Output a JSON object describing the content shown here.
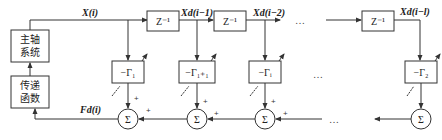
{
  "diagram": {
    "blocks": {
      "spindle_system": {
        "line1": "主轴",
        "line2": "系统"
      },
      "transfer_function": {
        "line1": "传递",
        "line2": "函数"
      },
      "delays": [
        {
          "label": "Z⁻¹"
        },
        {
          "label": "Z⁻¹"
        },
        {
          "label": "Z⁻¹"
        }
      ],
      "gains": [
        {
          "label": "−Γ₁"
        },
        {
          "label": "−Γ₁₊₁"
        },
        {
          "label": "−Γᵢ"
        },
        {
          "label": "−Γ₂"
        }
      ],
      "summers": [
        {
          "label": "Σ"
        },
        {
          "label": "Σ"
        },
        {
          "label": "Σ"
        },
        {
          "label": "Σ"
        }
      ]
    },
    "signals": {
      "x_i": "X(i)",
      "xd_i_1": "Xd(i−1)",
      "xd_i_2": "Xd(i−2)",
      "xd_i_l": "Xd(i−l)",
      "fd_i": "Fd(i)"
    },
    "plus_sign": "+",
    "ellipsis": "…"
  }
}
